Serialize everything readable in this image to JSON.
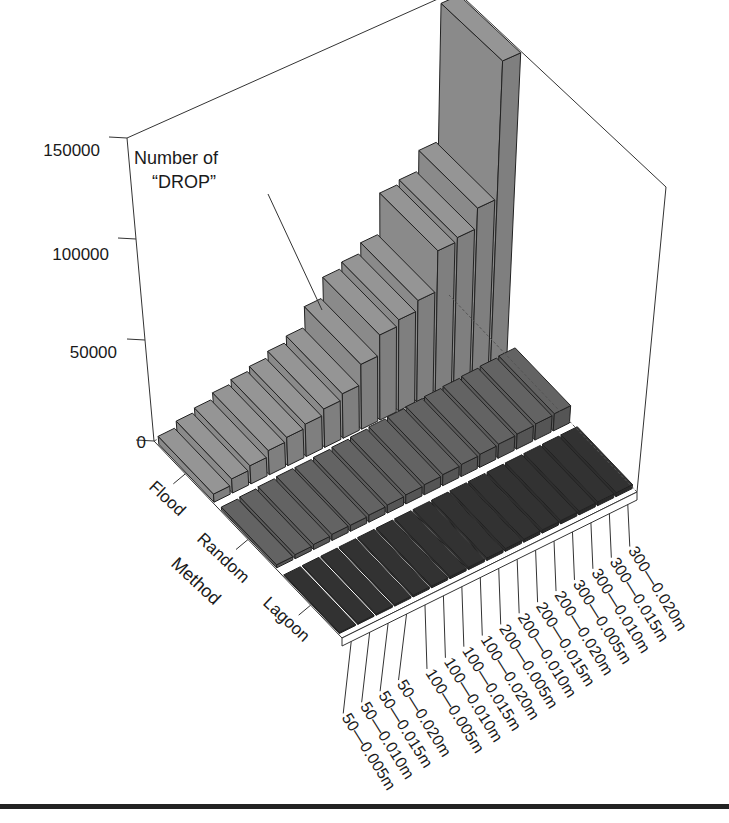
{
  "chart_data": {
    "type": "bar3d",
    "title": "",
    "zlabel": "Number of “DROP”",
    "ylabel": "Method",
    "z_ticks": [
      0,
      50000,
      100000,
      150000
    ],
    "zlim": [
      0,
      150000
    ],
    "methods": [
      "Flood",
      "Random",
      "Lagoon"
    ],
    "categories": [
      "50—0.005m",
      "50—0.010m",
      "50—0.015m",
      "50—0.020m",
      "100—0.005m",
      "100—0.010m",
      "100—0.015m",
      "100—0.020m",
      "200—0.005m",
      "200—0.010m",
      "200—0.015m",
      "200—0.020m",
      "300—0.005m",
      "300—0.010m",
      "300—0.015m",
      "300—0.020m"
    ],
    "series": [
      {
        "name": "Flood",
        "color": "#8a8a8a",
        "values": [
          4000,
          7000,
          9000,
          12000,
          14000,
          16000,
          19000,
          22000,
          32000,
          42000,
          45000,
          50000,
          70000,
          72000,
          82000,
          150000
        ]
      },
      {
        "name": "Random",
        "color": "#5c5c5c",
        "values": [
          1500,
          2000,
          2500,
          3000,
          3000,
          3500,
          4000,
          4500,
          5000,
          5500,
          6000,
          6500,
          7000,
          7500,
          8000,
          8500
        ]
      },
      {
        "name": "Lagoon",
        "color": "#2e2e2e",
        "values": [
          500,
          600,
          700,
          800,
          900,
          1000,
          1100,
          1200,
          1300,
          1400,
          1500,
          1600,
          1700,
          1800,
          1900,
          2000
        ]
      }
    ],
    "grid": false,
    "legend": "none"
  },
  "axes": {
    "z_tick_labels": [
      "0",
      "50000",
      "100000",
      "150000"
    ],
    "method_labels": [
      "Flood",
      "Random",
      "Lagoon"
    ],
    "method_title": "Method",
    "z_title_line1": "Number of",
    "z_title_line2": "“DROP”"
  }
}
